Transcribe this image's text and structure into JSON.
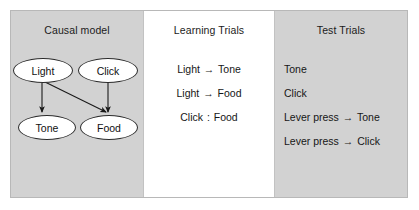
{
  "figure": {
    "background_gray": "#d2d2d2",
    "background_white": "#ffffff",
    "border_color": "#b8b8b8",
    "text_color": "#161616"
  },
  "panels": {
    "causal": {
      "title": "Causal model",
      "nodes": [
        {
          "id": "light",
          "label": "Light"
        },
        {
          "id": "click",
          "label": "Click"
        },
        {
          "id": "tone",
          "label": "Tone"
        },
        {
          "id": "food",
          "label": "Food"
        }
      ],
      "edges": [
        {
          "from": "Light",
          "to": "Tone"
        },
        {
          "from": "Light",
          "to": "Food"
        },
        {
          "from": "Click",
          "to": "Food"
        }
      ]
    },
    "learning": {
      "title": "Learning Trials",
      "items": [
        {
          "left": "Light",
          "relation": "→",
          "right": "Tone"
        },
        {
          "left": "Light",
          "relation": "→",
          "right": "Food"
        },
        {
          "left": "Click",
          "relation": ":",
          "right": "Food"
        }
      ]
    },
    "test": {
      "title": "Test Trials",
      "items": [
        {
          "left": "Tone",
          "relation": "",
          "right": ""
        },
        {
          "left": "Click",
          "relation": "",
          "right": ""
        },
        {
          "left": "Lever press",
          "relation": "→",
          "right": "Tone"
        },
        {
          "left": "Lever press",
          "relation": "→",
          "right": "Click"
        }
      ]
    }
  }
}
